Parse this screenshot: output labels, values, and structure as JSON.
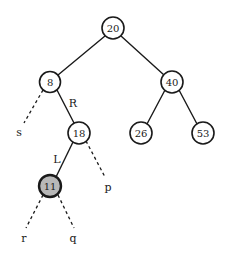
{
  "figure": {
    "kind": "binary-search-tree-diagram",
    "background_color": "#ffffff",
    "stroke_color": "#1a1a1a",
    "node_fill_default": "#ffffff",
    "node_fill_highlight": "#b8b8b8"
  },
  "nodes": [
    {
      "id": "n20",
      "label": "20",
      "cx": 113,
      "cy": 28,
      "r": 11,
      "fill": "#ffffff",
      "stroke_width": 1.6,
      "highlighted": false
    },
    {
      "id": "n8",
      "label": "8",
      "cx": 50,
      "cy": 82,
      "r": 10.5,
      "fill": "#ffffff",
      "stroke_width": 1.6,
      "highlighted": false
    },
    {
      "id": "n40",
      "label": "40",
      "cx": 172,
      "cy": 82,
      "r": 11,
      "fill": "#ffffff",
      "stroke_width": 1.6,
      "highlighted": false
    },
    {
      "id": "n18",
      "label": "18",
      "cx": 79,
      "cy": 133,
      "r": 11,
      "fill": "#ffffff",
      "stroke_width": 1.6,
      "highlighted": false
    },
    {
      "id": "n26",
      "label": "26",
      "cx": 141,
      "cy": 133,
      "r": 11,
      "fill": "#ffffff",
      "stroke_width": 1.6,
      "highlighted": false
    },
    {
      "id": "n53",
      "label": "53",
      "cx": 203,
      "cy": 133,
      "r": 11,
      "fill": "#ffffff",
      "stroke_width": 1.6,
      "highlighted": false
    },
    {
      "id": "n11",
      "label": "11",
      "cx": 50,
      "cy": 186,
      "r": 11,
      "fill": "#b8b8b8",
      "stroke_width": 2.4,
      "highlighted": true
    }
  ],
  "solid_edges": [
    {
      "id": "e20-8",
      "from": "n20",
      "to": "n8",
      "x1": 105,
      "y1": 36,
      "x2": 58,
      "y2": 75
    },
    {
      "id": "e20-40",
      "from": "n20",
      "to": "n40",
      "x1": 121,
      "y1": 36,
      "x2": 164,
      "y2": 75
    },
    {
      "id": "e8-18",
      "from": "n8",
      "to": "n18",
      "x1": 57,
      "y1": 90,
      "x2": 74,
      "y2": 123
    },
    {
      "id": "e40-26",
      "from": "n40",
      "to": "n26",
      "x1": 165,
      "y1": 90,
      "x2": 147,
      "y2": 124
    },
    {
      "id": "e40-53",
      "from": "n40",
      "to": "n53",
      "x1": 179,
      "y1": 90,
      "x2": 197,
      "y2": 124
    },
    {
      "id": "e18-11",
      "from": "n18",
      "to": "n11",
      "x1": 73,
      "y1": 142,
      "x2": 56,
      "y2": 177
    }
  ],
  "dashed_edges": [
    {
      "id": "d8-s",
      "from": "n8",
      "to": "s",
      "x1": 43,
      "y1": 90,
      "x2": 24,
      "y2": 123
    },
    {
      "id": "d18-p",
      "from": "n18",
      "to": "p",
      "x1": 86,
      "y1": 141,
      "x2": 105,
      "y2": 177
    },
    {
      "id": "d11-r",
      "from": "n11",
      "to": "r",
      "x1": 43,
      "y1": 195,
      "x2": 26,
      "y2": 228
    },
    {
      "id": "d11-q",
      "from": "n11",
      "to": "q",
      "x1": 58,
      "y1": 195,
      "x2": 74,
      "y2": 228
    }
  ],
  "edge_labels": [
    {
      "id": "label-R",
      "text": "R",
      "x": 73,
      "y": 103
    },
    {
      "id": "label-L",
      "text": "L",
      "x": 57,
      "y": 159
    }
  ],
  "leaf_labels": [
    {
      "id": "leaf-s",
      "text": "s",
      "x": 19,
      "y": 132
    },
    {
      "id": "leaf-p",
      "text": "p",
      "x": 108,
      "y": 187
    },
    {
      "id": "leaf-r",
      "text": "r",
      "x": 24,
      "y": 238
    },
    {
      "id": "leaf-q",
      "text": "q",
      "x": 73,
      "y": 238
    }
  ]
}
